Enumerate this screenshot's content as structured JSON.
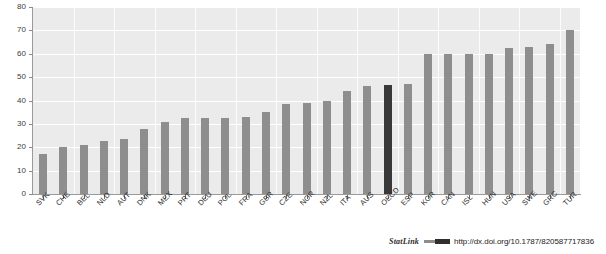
{
  "chart_data": {
    "type": "bar",
    "title": "",
    "xlabel": "",
    "ylabel": "",
    "ylim": [
      0,
      80
    ],
    "yticks": [
      0,
      10,
      20,
      30,
      40,
      50,
      60,
      70,
      80
    ],
    "grid": "horizontal-and-vertical",
    "legend": "none",
    "categories": [
      "SVK",
      "CHE",
      "BEL",
      "NLD",
      "AUT",
      "DNK",
      "MEX",
      "PRT",
      "DEU",
      "POL",
      "FRA",
      "GBR",
      "CZE",
      "NOR",
      "NZL",
      "ITA",
      "AUS",
      "OECD",
      "ESP",
      "KOR",
      "CAN",
      "ISL",
      "HUN",
      "USA",
      "SWE",
      "GRC",
      "TUR"
    ],
    "values": [
      17,
      20,
      21,
      22.5,
      23.5,
      28,
      31,
      32.5,
      32.5,
      32.5,
      33,
      35,
      38.5,
      39,
      40,
      44,
      46,
      46.5,
      47,
      60,
      60,
      60,
      60,
      62.5,
      63,
      64,
      70
    ],
    "highlight_category": "OECD",
    "series": [
      {
        "name": "value",
        "values": [
          17,
          20,
          21,
          22.5,
          23.5,
          28,
          31,
          32.5,
          32.5,
          32.5,
          33,
          35,
          38.5,
          39,
          40,
          44,
          46,
          46.5,
          47,
          60,
          60,
          60,
          60,
          62.5,
          63,
          64,
          70
        ]
      }
    ],
    "colors": {
      "bar": "#8e8e8e",
      "highlight_bar": "#393939",
      "plot_background": "#ebebeb",
      "gridline": "#ffffff",
      "axis": "#9a9a9a"
    }
  },
  "footer": {
    "statlink_label": "StatLink",
    "url": "http://dx.doi.org/10.1787/820587717836"
  }
}
